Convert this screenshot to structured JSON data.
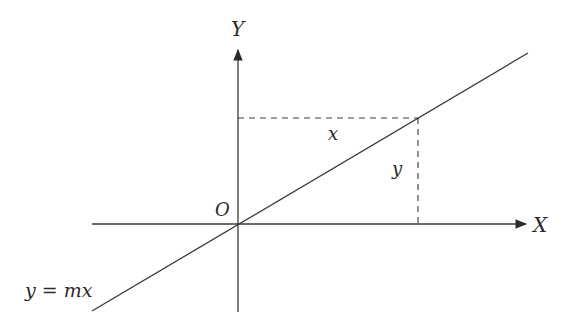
{
  "diagram": {
    "type": "coordinate-line-through-origin",
    "axes": {
      "x_label": "X",
      "y_label": "Y",
      "origin_label": "O"
    },
    "line": {
      "equation_label": "y = mx"
    },
    "point_projection": {
      "horizontal_label": "x",
      "vertical_label": "y"
    },
    "colors": {
      "stroke": "#3a3a3a",
      "text": "#2a2a2a",
      "background": "#ffffff"
    }
  }
}
